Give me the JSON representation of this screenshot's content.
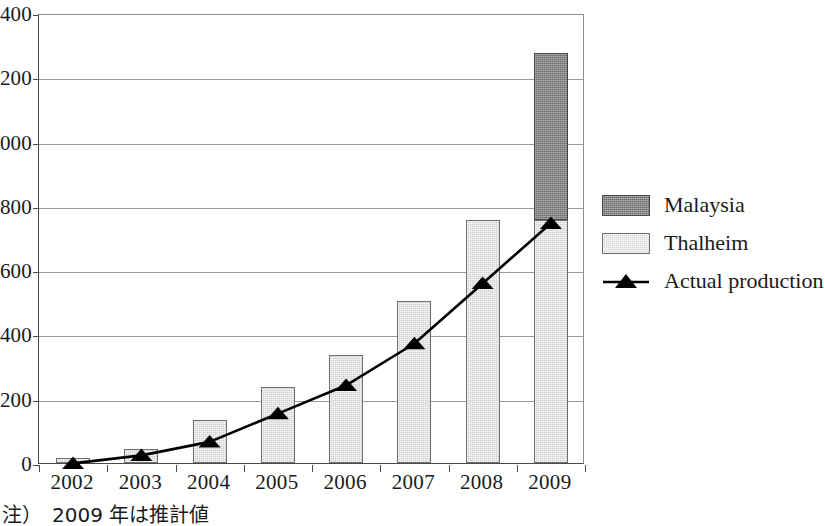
{
  "chart_data": {
    "type": "bar",
    "title": "",
    "subtitle": "",
    "xlabel": "",
    "ylabel": "",
    "categories": [
      "2002",
      "2003",
      "2004",
      "2005",
      "2006",
      "2007",
      "2008",
      "2009"
    ],
    "ylim": [
      0,
      1400
    ],
    "ytick_values": [
      0,
      200,
      400,
      600,
      800,
      1000,
      1200,
      1400
    ],
    "ytick_labels": [
      "0",
      "200",
      "400",
      "600",
      "800",
      "1,000",
      "1,200",
      "1,400"
    ],
    "grid": true,
    "stacked": true,
    "legend_position": "right",
    "series": [
      {
        "name": "Malaysia",
        "kind": "bar",
        "color": "#6a6a6a",
        "values": [
          0,
          0,
          0,
          0,
          0,
          0,
          0,
          520
        ]
      },
      {
        "name": "Thalheim",
        "kind": "bar",
        "color": "#cfcfcf",
        "values": [
          15,
          45,
          135,
          235,
          335,
          505,
          755,
          755
        ]
      },
      {
        "name": "Actual production",
        "kind": "line",
        "color": "#000000",
        "marker": "triangle",
        "values": [
          5,
          30,
          72,
          160,
          248,
          378,
          565,
          752
        ]
      }
    ],
    "annotations": [
      "注）　2009 年は推計値"
    ]
  },
  "legend": {
    "items": [
      {
        "label": "Malaysia",
        "key": "swatch-malaysia"
      },
      {
        "label": "Thalheim",
        "key": "swatch-thalheim"
      },
      {
        "label": "Actual production",
        "key": "line-marker"
      }
    ]
  },
  "footnote": {
    "text": "注）　2009 年は推計値"
  }
}
